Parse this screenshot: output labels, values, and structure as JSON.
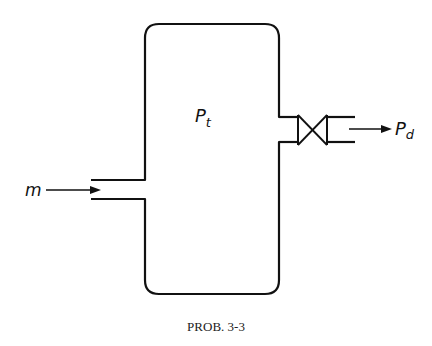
{
  "diagram": {
    "caption": "PROB. 3-3",
    "tank": {
      "label_main": "P",
      "label_sub": "t",
      "description": "Tank with internal pressure P_t"
    },
    "inlet": {
      "label": "m",
      "description": "Inlet mass flow m entering tank from left"
    },
    "outlet": {
      "label_main": "P",
      "label_sub": "d",
      "description": "Outlet through valve to downstream pressure P_d"
    },
    "valve": {
      "type": "gate-valve-symbol"
    },
    "colors": {
      "stroke": "#111111",
      "background": "#ffffff"
    }
  }
}
